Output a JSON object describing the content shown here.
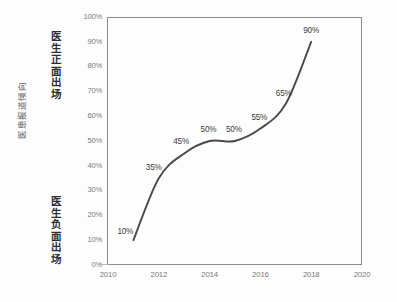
{
  "chart_data": {
    "type": "line",
    "title": "",
    "xlabel": "",
    "ylabel": "医患报道倾向",
    "xlim": [
      2010,
      2020
    ],
    "ylim": [
      0,
      100
    ],
    "grid": false,
    "legend": null,
    "x": [
      2011,
      2012,
      2013,
      2014,
      2015,
      2016,
      2017,
      2018
    ],
    "values": [
      10,
      35,
      45,
      50,
      50,
      55,
      65,
      90
    ],
    "point_labels": [
      "10%",
      "35%",
      "45%",
      "50%",
      "50%",
      "55%",
      "65%",
      "90%"
    ],
    "series": [
      {
        "name": "医生正面出场比例",
        "values": [
          10,
          35,
          45,
          50,
          50,
          55,
          65,
          90
        ]
      }
    ],
    "xticks": [
      "2010",
      "2012",
      "2014",
      "2016",
      "2018",
      "2020"
    ],
    "xtick_values": [
      2010,
      2012,
      2014,
      2016,
      2018,
      2020
    ],
    "yticks": [
      "0%",
      "10%",
      "20%",
      "30%",
      "40%",
      "50%",
      "60%",
      "70%",
      "80%",
      "90%",
      "100%"
    ],
    "ytick_values": [
      0,
      10,
      20,
      30,
      40,
      50,
      60,
      70,
      80,
      90,
      100
    ],
    "annotations": {
      "axis_pole_top": "医生正面出场",
      "axis_pole_bottom": "医生负面出场"
    },
    "colors": {
      "line": "#4a4a4a",
      "frame": "#8d8d8d",
      "tick_text": "#7a7a7a",
      "label_text": "#3c3c3c",
      "background": "#fdfdfd"
    }
  },
  "axis": {
    "title": "医患报道倾向",
    "pole_top": "医生正面出场",
    "pole_bottom": "医生负面出场"
  }
}
